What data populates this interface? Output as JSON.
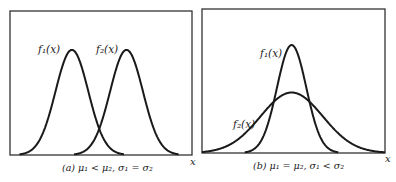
{
  "figure": {
    "panels": [
      {
        "id": "a",
        "caption": "(a) μ₁ < μ₂, σ₁ = σ₂",
        "x_axis_label": "x",
        "curves": [
          {
            "label": "f₁(x)",
            "mean": "μ₁",
            "sigma": "σ₁"
          },
          {
            "label": "f₂(x)",
            "mean": "μ₂",
            "sigma": "σ₂"
          }
        ]
      },
      {
        "id": "b",
        "caption": "(b) μ₁ = μ₂, σ₁ < σ₂",
        "x_axis_label": "x",
        "curves": [
          {
            "label": "f₁(x)",
            "mean": "μ₁",
            "sigma": "σ₁"
          },
          {
            "label": "f₂(x)",
            "mean": "μ₂",
            "sigma": "σ₂"
          }
        ]
      }
    ],
    "colors": {
      "line": "#1a1a1a",
      "frame": "#333333",
      "background": "#ffffff"
    }
  },
  "chart_data": [
    {
      "type": "line",
      "title": "(a) μ₁ < μ₂, σ₁ = σ₂",
      "xlabel": "x",
      "ylabel": "",
      "grid": false,
      "legend": "inline labels",
      "series": [
        {
          "name": "f₁(x)",
          "distribution": "normal",
          "relative_mean": 0.34,
          "relative_sigma": 0.09,
          "relative_peak": 0.73
        },
        {
          "name": "f₂(x)",
          "distribution": "normal",
          "relative_mean": 0.64,
          "relative_sigma": 0.09,
          "relative_peak": 0.73
        }
      ]
    },
    {
      "type": "line",
      "title": "(b) μ₁ = μ₂, σ₁ < σ₂",
      "xlabel": "x",
      "ylabel": "",
      "grid": false,
      "legend": "inline labels",
      "series": [
        {
          "name": "f₁(x)",
          "distribution": "normal",
          "relative_mean": 0.49,
          "relative_sigma": 0.08,
          "relative_peak": 0.75
        },
        {
          "name": "f₂(x)",
          "distribution": "normal",
          "relative_mean": 0.49,
          "relative_sigma": 0.17,
          "relative_peak": 0.42
        }
      ]
    }
  ]
}
